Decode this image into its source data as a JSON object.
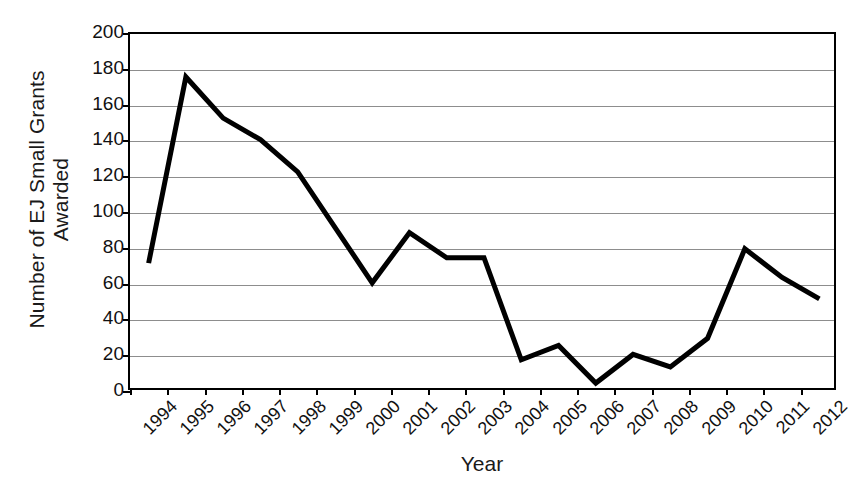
{
  "chart_data": {
    "type": "line",
    "title": "",
    "xlabel": "Year",
    "ylabel": "Number of EJ Small Grants Awarded",
    "ylabel_line1": "Number of EJ Small Grants",
    "ylabel_line2": "Awarded",
    "categories": [
      "1994",
      "1995",
      "1996",
      "1997",
      "1998",
      "1999",
      "2000",
      "2001",
      "2002",
      "2003",
      "2004",
      "2005",
      "2006",
      "2007",
      "2008",
      "2009",
      "2010",
      "2011",
      "2012"
    ],
    "values": [
      72,
      176,
      153,
      141,
      123,
      92,
      61,
      89,
      75,
      75,
      18,
      26,
      5,
      21,
      14,
      30,
      80,
      64,
      52
    ],
    "series": [
      {
        "name": "EJ Small Grants Awarded",
        "values": [
          72,
          176,
          153,
          141,
          123,
          92,
          61,
          89,
          75,
          75,
          18,
          26,
          5,
          21,
          14,
          30,
          80,
          64,
          52
        ]
      }
    ],
    "ylim": [
      0,
      200
    ],
    "ytick_values": [
      0,
      20,
      40,
      60,
      80,
      100,
      120,
      140,
      160,
      180,
      200
    ],
    "ytick_labels": [
      "0",
      "20",
      "40",
      "60",
      "80",
      "100",
      "120",
      "140",
      "160",
      "180",
      "200"
    ],
    "grid": true,
    "grid_axis": "y",
    "legend": false,
    "legend_position": "none",
    "line_color": "#000000",
    "line_width": 5,
    "grid_color": "#8d8d8d",
    "axis_color": "#000000",
    "background_color": "#ffffff",
    "xtick_rotation": -45
  }
}
